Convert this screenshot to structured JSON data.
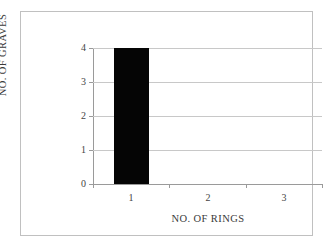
{
  "chart_data": {
    "type": "bar",
    "title": "",
    "xlabel": "NO. OF RINGS",
    "ylabel": "NO. OF GRAVES",
    "categories": [
      "1",
      "2",
      "3"
    ],
    "values": [
      4,
      0,
      0
    ],
    "series": [
      {
        "name": "NO. OF GRAVES",
        "values": [
          4,
          0,
          0
        ]
      }
    ],
    "ylim": [
      0,
      4
    ],
    "yticks": [
      "0",
      "1",
      "2",
      "3",
      "4"
    ],
    "xticks": [
      "1",
      "2",
      "3"
    ],
    "grid": "horizontal",
    "legend": "none",
    "bar_color": "#050505",
    "gridline_color": "#c8c8c8",
    "axis_color": "#9a9a9a",
    "frame_color": "#c0c0c0",
    "background_color": "#ffffff"
  }
}
